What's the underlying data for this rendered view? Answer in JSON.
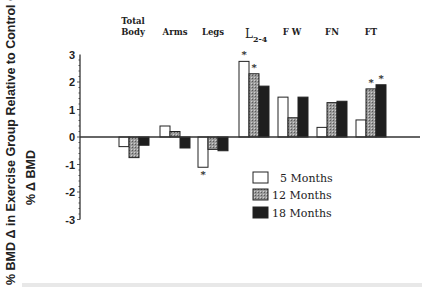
{
  "chart_data": {
    "type": "bar",
    "title": "",
    "xlabel": "",
    "ylabel": "% BMD Δ in Exercise Group Relative to Control Group",
    "ylabel_secondary": "% Δ BMD",
    "ylim": [
      -3,
      3
    ],
    "yticks": [
      3,
      2,
      1,
      0,
      -1,
      -2,
      -3
    ],
    "grid": false,
    "legend_position": "lower right",
    "categories": [
      "Total Body",
      "Arms",
      "Legs",
      "L2-4",
      "FW",
      "FN",
      "FT"
    ],
    "category_labels": [
      {
        "line1": "Total",
        "line2": "Body"
      },
      {
        "line1": "Arms",
        "line2": ""
      },
      {
        "line1": "Legs",
        "line2": ""
      },
      {
        "line1": "L",
        "sub": "2-4"
      },
      {
        "line1": "F W",
        "line2": ""
      },
      {
        "line1": "FN",
        "line2": ""
      },
      {
        "line1": "FT",
        "line2": ""
      }
    ],
    "series": [
      {
        "name": "5 Months",
        "fill": "#ffffff",
        "values": [
          -0.35,
          0.4,
          -1.1,
          2.75,
          1.45,
          0.35,
          0.62
        ]
      },
      {
        "name": "12 Months",
        "fill": "#8c8c8c",
        "values": [
          -0.75,
          0.2,
          -0.45,
          2.3,
          0.7,
          1.25,
          1.75
        ]
      },
      {
        "name": "18 Months",
        "fill": "#1e1e1e",
        "values": [
          -0.3,
          -0.4,
          -0.5,
          1.85,
          1.45,
          1.3,
          1.9
        ]
      }
    ],
    "significance_markers": [
      {
        "category": "Legs",
        "series": "5 Months",
        "symbol": "*"
      },
      {
        "category": "L2-4",
        "series": "5 Months",
        "symbol": "*"
      },
      {
        "category": "L2-4",
        "series": "12 Months",
        "symbol": "*"
      },
      {
        "category": "FT",
        "series": "12 Months",
        "symbol": "*"
      },
      {
        "category": "FT",
        "series": "18 Months",
        "symbol": "*"
      }
    ]
  },
  "legend": {
    "items": [
      {
        "label": "5 Months"
      },
      {
        "label": "12 Months"
      },
      {
        "label": "18 Months"
      }
    ]
  }
}
